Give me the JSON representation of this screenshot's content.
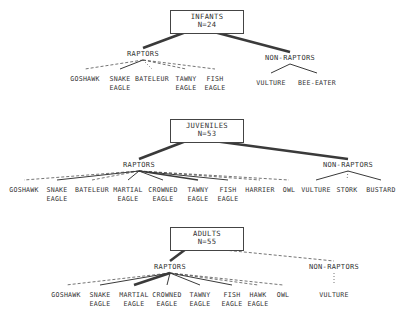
{
  "figure": {
    "background": "#ffffff",
    "line_color": "#3a3a3a",
    "text_color": "#333333"
  },
  "chart_data": {
    "type": "diagram",
    "title": "",
    "blocks": [
      {
        "id": "infants",
        "root": {
          "line1": "INFANTS",
          "line2": "N=24"
        },
        "groups": [
          {
            "name": "RAPTORS",
            "link_style": "thick-solid",
            "leaves": [
              {
                "label": "GOSHAWK",
                "line1": "GOSHAWK",
                "line2": "",
                "style": "dashed"
              },
              {
                "label": "SNAKE EAGLE",
                "line1": "SNAKE",
                "line2": "EAGLE",
                "style": "solid"
              },
              {
                "label": "BATELEUR",
                "line1": "BATELEUR",
                "line2": "",
                "style": "dotted"
              },
              {
                "label": "TAWNY EAGLE",
                "line1": "TAWNY",
                "line2": "EAGLE",
                "style": "dashed"
              },
              {
                "label": "FISH EAGLE",
                "line1": "FISH",
                "line2": "EAGLE",
                "style": "dashed"
              }
            ]
          },
          {
            "name": "NON-RAPTORS",
            "link_style": "thick-solid",
            "leaves": [
              {
                "label": "VULTURE",
                "line1": "VULTURE",
                "line2": "",
                "style": "solid"
              },
              {
                "label": "BEE-EATER",
                "line1": "BEE-EATER",
                "line2": "",
                "style": "solid"
              }
            ]
          }
        ]
      },
      {
        "id": "juveniles",
        "root": {
          "line1": "JUVENILES",
          "line2": "N=53"
        },
        "groups": [
          {
            "name": "RAPTORS",
            "link_style": "thick-solid",
            "leaves": [
              {
                "label": "GOSHAWK",
                "line1": "GOSHAWK",
                "line2": "",
                "style": "dashed"
              },
              {
                "label": "SNAKE EAGLE",
                "line1": "SNAKE",
                "line2": "EAGLE",
                "style": "solid"
              },
              {
                "label": "BATELEUR",
                "line1": "BATELEUR",
                "line2": "",
                "style": "dashed"
              },
              {
                "label": "MARTIAL EAGLE",
                "line1": "MARTIAL",
                "line2": "EAGLE",
                "style": "solid"
              },
              {
                "label": "CROWNED EAGLE",
                "line1": "CROWNED",
                "line2": "EAGLE",
                "style": "solid"
              },
              {
                "label": "TAWNY EAGLE",
                "line1": "TAWNY",
                "line2": "EAGLE",
                "style": "medium-solid"
              },
              {
                "label": "FISH EAGLE",
                "line1": "FISH",
                "line2": "EAGLE",
                "style": "solid"
              },
              {
                "label": "HARRIER",
                "line1": "HARRIER",
                "line2": "",
                "style": "dashed"
              },
              {
                "label": "OWL",
                "line1": "OWL",
                "line2": "",
                "style": "dashed"
              }
            ]
          },
          {
            "name": "NON-RAPTORS",
            "link_style": "thick-solid",
            "leaves": [
              {
                "label": "VULTURE",
                "line1": "VULTURE",
                "line2": "",
                "style": "solid"
              },
              {
                "label": "STORK",
                "line1": "STORK",
                "line2": "",
                "style": "dotted"
              },
              {
                "label": "BUSTARD",
                "line1": "BUSTARD",
                "line2": "",
                "style": "solid"
              }
            ]
          }
        ]
      },
      {
        "id": "adults",
        "root": {
          "line1": "ADULTS",
          "line2": "N=55"
        },
        "groups": [
          {
            "name": "RAPTORS",
            "link_style": "thick-solid",
            "leaves": [
              {
                "label": "GOSHAWK",
                "line1": "GOSHAWK",
                "line2": "",
                "style": "dashed"
              },
              {
                "label": "SNAKE EAGLE",
                "line1": "SNAKE",
                "line2": "EAGLE",
                "style": "solid"
              },
              {
                "label": "MARTIAL EAGLE",
                "line1": "MARTIAL",
                "line2": "EAGLE",
                "style": "thick-solid"
              },
              {
                "label": "CROWNED EAGLE",
                "line1": "CROWNED",
                "line2": "EAGLE",
                "style": "solid"
              },
              {
                "label": "TAWNY EAGLE",
                "line1": "TAWNY",
                "line2": "EAGLE",
                "style": "solid"
              },
              {
                "label": "FISH EAGLE",
                "line1": "FISH",
                "line2": "EAGLE",
                "style": "solid"
              },
              {
                "label": "HAWK EAGLE",
                "line1": "HAWK",
                "line2": "EAGLE",
                "style": "dashed"
              },
              {
                "label": "OWL",
                "line1": "OWL",
                "line2": "",
                "style": "dashed"
              }
            ]
          },
          {
            "name": "NON-RAPTORS",
            "link_style": "dashed",
            "leaves": [
              {
                "label": "VULTURE",
                "line1": "VULTURE",
                "line2": "",
                "style": "dotted"
              }
            ]
          }
        ]
      }
    ]
  }
}
